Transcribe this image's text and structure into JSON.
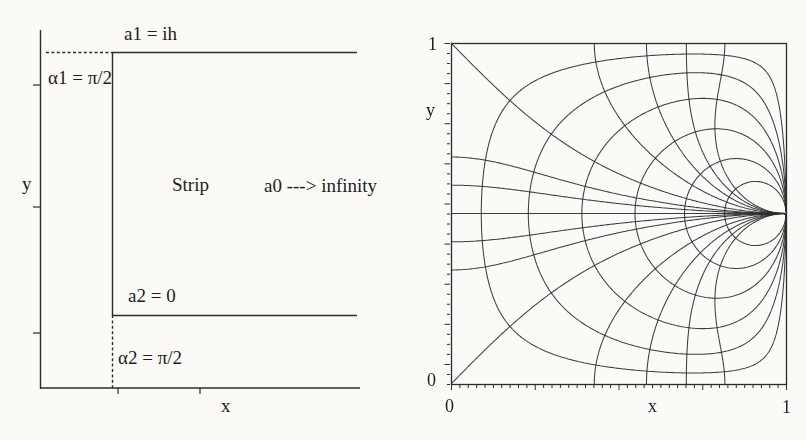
{
  "page": {
    "background": "#fbfaf6",
    "ink": "#2c2c2c"
  },
  "left_figure": {
    "label_a1": "a1 = ih",
    "label_alpha1": "α1 = π/2",
    "label_y_axis": "y",
    "label_strip": "Strip",
    "label_a0": "a0 ---> infinity",
    "label_a2": "a2 = 0",
    "label_alpha2": "α2 = π/2",
    "label_x_axis": "x"
  },
  "right_figure": {
    "ytick_top": "1",
    "ytick_bottom": "0",
    "label_y_axis": "y",
    "xtick_left": "0",
    "xtick_right": "1",
    "label_x_axis": "x"
  },
  "chart_data": {
    "type": "line",
    "title": "",
    "xlabel": "x",
    "ylabel": "y",
    "xlim": [
      0,
      1
    ],
    "ylim": [
      0,
      1
    ],
    "x_tick_labels": [
      "0",
      "1"
    ],
    "y_tick_labels": [
      "0",
      "1"
    ],
    "grid": false,
    "legend": "none",
    "convergence_point": [
      1,
      0.5
    ],
    "construction": "Orthogonal conformal grid in the unit square: preimages of the Cartesian grid of the upper half-plane under t = sn(K(2y-1) + i*K'*x) with K'/K = 2; the point (1, 1/2) is the preimage of infinity (vertex a0 of the strip polygon).",
    "families": [
      {
        "name": "rays-Re-t-constant",
        "description": "curves from the square boundary converging at (1, 0.5); levels ±1 are the 45° diagonals from corners (0,0) and (0,1)",
        "levels": [
          0,
          0.26,
          -0.26,
          0.5,
          -0.5,
          1,
          -1,
          2,
          -2,
          3,
          -3,
          4,
          -4,
          5,
          -5
        ]
      },
      {
        "name": "loops-Im-t-constant",
        "description": "closed loops around (1, 0.5) hugging the boundary, orthogonal to the rays",
        "levels": [
          0.29,
          0.8,
          1.6,
          2.9,
          5.2,
          9.5
        ]
      }
    ]
  }
}
